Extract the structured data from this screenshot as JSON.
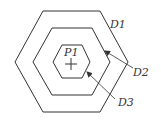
{
  "diagram": {
    "center_label": "P1",
    "labels": {
      "outer": "D1",
      "middle": "D2",
      "inner": "D3"
    },
    "colors": {
      "stroke": "#333333",
      "background": "#ffffff"
    }
  }
}
